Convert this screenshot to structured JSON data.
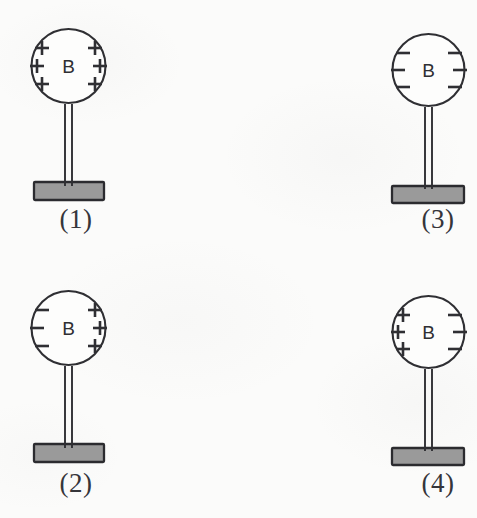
{
  "figure": {
    "kind": "electroscope-charge-distribution-diagram",
    "background_color": "#fbfbfa",
    "ink_color": "#2f2f33",
    "base_fill_color": "#9a9a9a",
    "bulb_fill_color": "#fdfdfc",
    "bulb_letter": "B",
    "plus_symbol": "+",
    "minus_symbol": "−"
  },
  "panels": [
    {
      "caption": "(1)",
      "label_text": "B",
      "position": "top-left",
      "left_charges": [
        "+",
        "+",
        "+"
      ],
      "right_charges": [
        "+",
        "+",
        "+"
      ],
      "charge_summary": "all positive",
      "charge_count": 6
    },
    {
      "caption": "(2)",
      "label_text": "B",
      "position": "bottom-left",
      "left_charges": [
        "−",
        "−",
        "−"
      ],
      "right_charges": [
        "+",
        "+",
        "+"
      ],
      "charge_summary": "negative left, positive right",
      "charge_count": 6
    },
    {
      "caption": "(3)",
      "label_text": "B",
      "position": "top-right",
      "left_charges": [
        "−",
        "−",
        "−"
      ],
      "right_charges": [
        "−",
        "−",
        "−"
      ],
      "charge_summary": "all negative",
      "charge_count": 6
    },
    {
      "caption": "(4)",
      "label_text": "B",
      "position": "bottom-right",
      "left_charges": [
        "+",
        "+",
        "+"
      ],
      "right_charges": [
        "−",
        "−",
        "−"
      ],
      "charge_summary": "positive left, negative right",
      "charge_count": 6
    }
  ]
}
